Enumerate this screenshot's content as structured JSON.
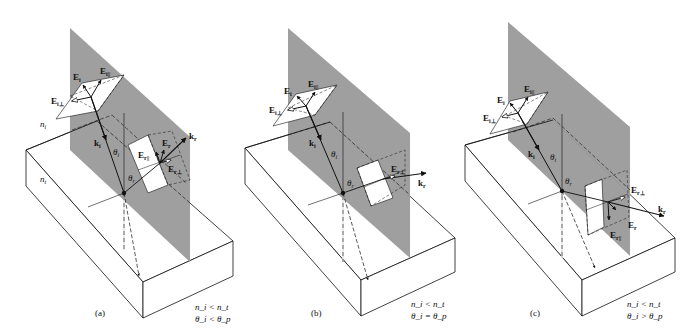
{
  "figure": {
    "colors": {
      "plane_of_incidence": "#9a9a9a",
      "lines": "#111111",
      "background": "#ffffff"
    },
    "panels": [
      {
        "id": "a",
        "caption": "(a)",
        "condition_index": "n_i < n_t",
        "condition_angle": "θ_i < θ_p",
        "cond1_text": "n",
        "labels": {
          "E_i": "E",
          "E_i_par": "E",
          "E_i_perp": "E",
          "k_i": "k",
          "theta_i": "θ",
          "theta_r": "θ",
          "n_i": "n",
          "n_t": "n",
          "E_r": "E",
          "E_r_par": "E",
          "E_r_perp": "E",
          "k_r": "k"
        }
      },
      {
        "id": "b",
        "caption": "(b)",
        "condition_index": "n_i < n_t",
        "condition_angle": "θ_i = θ_p",
        "labels": {
          "E_i": "E",
          "E_i_par": "E",
          "E_i_perp": "E",
          "k_i": "k",
          "theta_i": "θ",
          "theta_r": "θ",
          "E_r_perp": "E",
          "k_r": "k"
        }
      },
      {
        "id": "c",
        "caption": "(c)",
        "condition_index": "n_i < n_t",
        "condition_angle": "θ_i > θ_p",
        "labels": {
          "E_i": "E",
          "E_i_par": "E",
          "E_i_perp": "E",
          "k_i": "k",
          "theta_i": "θ",
          "theta_r": "θ",
          "E_r": "E",
          "E_r_par": "E",
          "E_r_perp": "E",
          "k_r": "k"
        }
      }
    ],
    "subscripts": {
      "i": "i",
      "t": "t",
      "r": "r",
      "p": "p",
      "par": "i||",
      "perp": "i⊥",
      "r_par": "r||",
      "r_perp": "r⊥"
    },
    "relations": {
      "lt": "<",
      "eq": "=",
      "gt": ">"
    }
  }
}
